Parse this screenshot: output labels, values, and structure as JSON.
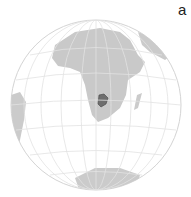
{
  "panel_label": "a",
  "map": {
    "projection": "orthographic",
    "highlighted_region": "Botswana",
    "colors": {
      "land": "#c8c8c8",
      "ocean": "#ffffff",
      "grid": "#e6e6e6",
      "highlight": "#6e6e6e",
      "outline": "#d0d0d0"
    }
  }
}
